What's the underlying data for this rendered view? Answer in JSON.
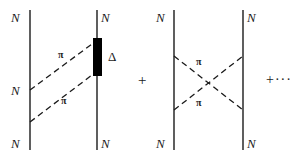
{
  "figure": {
    "kind": "feynman-diagram",
    "background_color": "#ffffff",
    "line_color": "#1a1a1a",
    "blob_color": "#000000"
  },
  "diagram_left": {
    "name": "two-pion-exchange-delta",
    "nucleon_labels": {
      "top_left": "N",
      "top_right": "N",
      "middle_left": "N",
      "bottom_left": "N",
      "bottom_right": "N"
    },
    "pion_labels": {
      "upper": "π",
      "lower": "π"
    },
    "resonance_label": "Δ"
  },
  "operator_middle": {
    "symbol": "+"
  },
  "diagram_right": {
    "name": "crossed-two-pion-exchange",
    "nucleon_labels": {
      "top_left": "N",
      "top_right": "N",
      "bottom_left": "N",
      "bottom_right": "N"
    },
    "pion_labels": {
      "upper": "π",
      "lower": "π"
    }
  },
  "operator_right": {
    "symbol": "+···"
  }
}
